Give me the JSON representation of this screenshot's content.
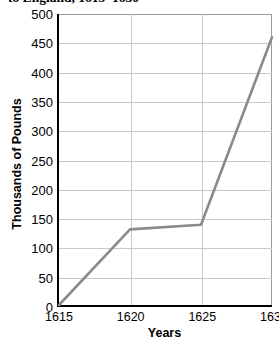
{
  "chart_data": {
    "type": "line",
    "title": "to England, 1615–1630",
    "xlabel": "Years",
    "ylabel": "Thousands of Pounds",
    "x": [
      1615,
      1620,
      1625,
      1630
    ],
    "values": [
      0,
      130,
      138,
      460
    ],
    "series": [
      {
        "name": "Value of imports",
        "values": [
          0,
          130,
          138,
          460
        ]
      }
    ],
    "xlim": [
      1615,
      1630
    ],
    "ylim": [
      0,
      500
    ],
    "y_ticks": [
      0,
      50,
      100,
      150,
      200,
      250,
      300,
      350,
      400,
      450,
      500
    ],
    "x_ticks": [
      1615,
      1620,
      1625,
      1630
    ],
    "y_tick_labels": [
      "0",
      "50",
      "100",
      "150",
      "200",
      "250",
      "300",
      "350",
      "400",
      "450",
      "500"
    ],
    "x_tick_labels": [
      "1615",
      "1620",
      "1625",
      "1630"
    ],
    "grid": true,
    "legend": false,
    "legend_position": "none",
    "line_color": "#8a8a8a",
    "axis_color": "#000000",
    "grid_color": "#c9c9c9"
  }
}
